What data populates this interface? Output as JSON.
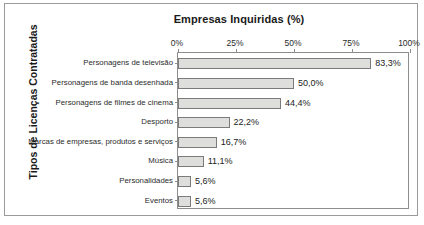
{
  "figure": {
    "title": "Empresas Inquiridas (%)",
    "yaxis_title": "Tipos de Licenças Contratadas"
  },
  "chart_data": {
    "type": "bar",
    "orientation": "horizontal",
    "title": "Empresas Inquiridas (%)",
    "xlabel": "Empresas Inquiridas (%)",
    "ylabel": "Tipos de Licenças Contratadas",
    "xlim": [
      0,
      100
    ],
    "grid": false,
    "legend": false,
    "decimal_separator": ",",
    "xtick_labels": [
      "0%",
      "25%",
      "50%",
      "75%",
      "100%"
    ],
    "xtick_values": [
      0,
      25,
      50,
      75,
      100
    ],
    "categories": [
      "Personagens de televisão",
      "Personagens de banda desenhada",
      "Personagens de filmes de cinema",
      "Desporto",
      "Marcas de empresas, produtos e serviços",
      "Música",
      "Personalidades",
      "Eventos"
    ],
    "values": [
      83.3,
      50.0,
      44.4,
      22.2,
      16.7,
      11.1,
      5.6,
      5.6
    ],
    "value_labels": [
      "83,3%",
      "50,0%",
      "44,4%",
      "22,2%",
      "16,7%",
      "11,1%",
      "5,6%",
      "5,6%"
    ],
    "bar_fill_color": "#dededd",
    "bar_border_color": "#7b7b7b"
  }
}
